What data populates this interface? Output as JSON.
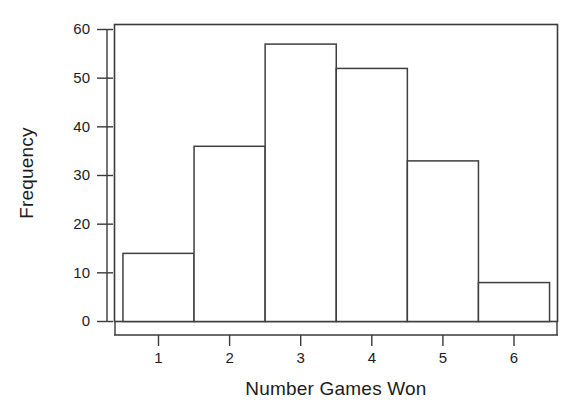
{
  "chart_data": {
    "type": "bar",
    "title": "",
    "subtitle": "",
    "xlabel": "Number Games Won",
    "ylabel": "Frequency",
    "categories": [
      "1",
      "2",
      "3",
      "4",
      "5",
      "6"
    ],
    "values": [
      14,
      36,
      57,
      52,
      33,
      8
    ],
    "bin_edges": [
      0.5,
      1.5,
      2.5,
      3.5,
      4.5,
      5.5,
      6.5
    ],
    "xlim": [
      0.5,
      6.5
    ],
    "ylim": [
      0,
      62
    ],
    "x_ticks": [
      "1",
      "2",
      "3",
      "4",
      "5",
      "6"
    ],
    "y_ticks": [
      "0",
      "10",
      "20",
      "30",
      "40",
      "50",
      "60"
    ],
    "y_tick_values": [
      0,
      10,
      20,
      30,
      40,
      50,
      60
    ],
    "grid": false,
    "legend": false,
    "legend_position": "none",
    "series": [
      {
        "name": "Frequency",
        "values": [
          14,
          36,
          57,
          52,
          33,
          8
        ]
      }
    ],
    "annotations": [],
    "colors": {
      "bar_fill": "#ffffff",
      "bar_stroke": "#3f3f3f",
      "axis": "#3a3a3a",
      "text": "#1c1c1c",
      "background": "#ffffff"
    }
  }
}
